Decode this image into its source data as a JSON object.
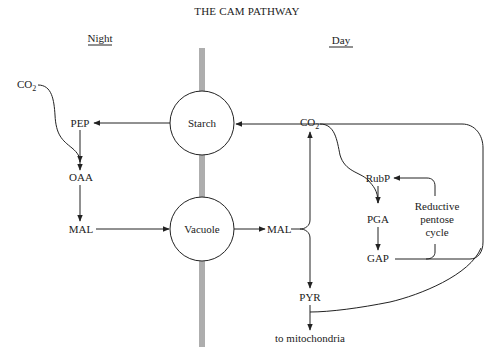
{
  "title": "THE CAM PATHWAY",
  "sections": {
    "night": "Night",
    "day": "Day"
  },
  "compartments": {
    "starch": "Starch",
    "vacuole": "Vacuole"
  },
  "night_nodes": {
    "co2": "CO",
    "co2_sub": "2",
    "pep": "PEP",
    "oaa": "OAA",
    "mal": "MAL"
  },
  "day_nodes": {
    "mal": "MAL",
    "co2": "CO",
    "co2_sub": "2",
    "rubp": "RubP",
    "pga": "PGA",
    "gap": "GAP",
    "pyr": "PYR",
    "mitochondria": "to mitochondria",
    "cycle_line1": "Reductive",
    "cycle_line2": "pentose",
    "cycle_line3": "cycle"
  },
  "colors": {
    "ink": "#222222",
    "background": "#ffffff"
  }
}
